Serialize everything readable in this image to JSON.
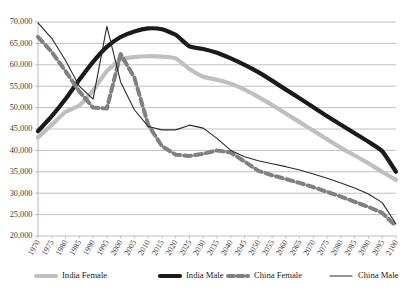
{
  "chart_data": {
    "type": "line",
    "title": "",
    "xlabel": "",
    "ylabel": "",
    "grid": "horizontal",
    "legend_position": "bottom",
    "ylim": [
      20000,
      70000
    ],
    "ytick_labels": [
      "70,000",
      "65,000",
      "60,000",
      "55,000",
      "50,000",
      "45,000",
      "40,000",
      "35,000",
      "30,000",
      "25,000",
      "20,000"
    ],
    "ytick_values": [
      70000,
      65000,
      60000,
      55000,
      50000,
      45000,
      40000,
      35000,
      30000,
      25000,
      20000
    ],
    "categories": [
      "1970",
      "1975",
      "1980",
      "1985",
      "1990",
      "1995",
      "2000",
      "2005",
      "2010",
      "2015",
      "2020",
      "2025",
      "2030",
      "2035",
      "2040",
      "2045",
      "2050",
      "2055",
      "2060",
      "2065",
      "2070",
      "2075",
      "2080",
      "2085",
      "2090",
      "2095",
      "2100"
    ],
    "x": [
      1970,
      1975,
      1980,
      1985,
      1990,
      1995,
      2000,
      2005,
      2010,
      2015,
      2020,
      2025,
      2030,
      2035,
      2040,
      2045,
      2050,
      2055,
      2060,
      2065,
      2070,
      2075,
      2080,
      2085,
      2090,
      2095,
      2100
    ],
    "series": [
      {
        "name": "India Female",
        "color": "#bfbfbf",
        "style": "solid-thick",
        "values": [
          43000,
          46000,
          49000,
          50500,
          54000,
          58500,
          61200,
          61800,
          62000,
          61900,
          61500,
          59000,
          57200,
          56500,
          55600,
          54200,
          52500,
          50600,
          48600,
          46600,
          44600,
          42600,
          40600,
          38800,
          37000,
          35000,
          33100
        ]
      },
      {
        "name": "India Male",
        "color": "#1a1a1a",
        "style": "solid-thick",
        "values": [
          44500,
          48000,
          52000,
          56500,
          60700,
          64200,
          66500,
          67800,
          68500,
          68300,
          67000,
          64300,
          63700,
          62800,
          61500,
          60000,
          58300,
          56300,
          54200,
          52200,
          50100,
          48000,
          46000,
          44000,
          42000,
          39800,
          35000
        ]
      },
      {
        "name": "China Female",
        "color": "#808080",
        "style": "dashed-thick",
        "values": [
          66500,
          63000,
          58500,
          53800,
          50000,
          49800,
          62500,
          57000,
          46000,
          41000,
          39000,
          38700,
          39200,
          40000,
          39500,
          37400,
          35200,
          34200,
          33300,
          32400,
          31400,
          30300,
          29200,
          28000,
          26800,
          25400,
          22300
        ]
      },
      {
        "name": "China Male",
        "color": "#2a2a2a",
        "style": "solid-thin",
        "values": [
          69800,
          66200,
          61000,
          55000,
          52000,
          69000,
          56000,
          49500,
          45600,
          44800,
          44800,
          45900,
          45200,
          42800,
          40000,
          38500,
          37600,
          36900,
          36200,
          35400,
          34500,
          33500,
          32400,
          31200,
          29800,
          27800,
          22800
        ]
      }
    ]
  },
  "legend": {
    "items": [
      {
        "label": "India Female",
        "color": "#bfbfbf",
        "style": "solid-thick"
      },
      {
        "label": "India Male",
        "color": "#1a1a1a",
        "style": "solid-thick"
      },
      {
        "label": "China Female",
        "color": "#808080",
        "style": "dashed-thick"
      },
      {
        "label": "China Male",
        "color": "#2a2a2a",
        "style": "solid-thin"
      }
    ]
  },
  "plot": {
    "left": 38,
    "right": 396,
    "top": 22,
    "bottom": 236
  }
}
